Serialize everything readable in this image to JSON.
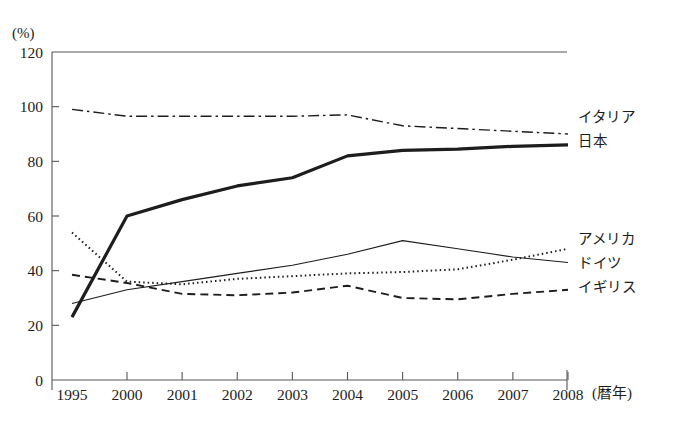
{
  "chart_data": {
    "type": "line",
    "title": "",
    "unit_label": "(%)",
    "xlabel": "(暦年)",
    "ylabel": "",
    "x": [
      1995,
      2000,
      2001,
      2002,
      2003,
      2004,
      2005,
      2006,
      2007,
      2008
    ],
    "categories": [
      "1995",
      "2000",
      "2001",
      "2002",
      "2003",
      "2004",
      "2005",
      "2006",
      "2007",
      "2008"
    ],
    "ylim": [
      0,
      120
    ],
    "yticks": [
      0,
      20,
      40,
      60,
      80,
      100,
      120
    ],
    "grid": false,
    "legend_position": "right-inline",
    "series": [
      {
        "name": "イタリア",
        "style": "dash-dot",
        "values": [
          99,
          96.5,
          96.5,
          96.5,
          96.5,
          97,
          93,
          92,
          91,
          90
        ]
      },
      {
        "name": "日本",
        "style": "thick-solid",
        "values": [
          23,
          60,
          66,
          71,
          74,
          82,
          84,
          84.5,
          85.5,
          86
        ]
      },
      {
        "name": "アメリカ",
        "style": "dotted",
        "values": [
          54,
          36,
          35,
          37,
          38,
          39,
          39.5,
          40.5,
          44,
          48
        ]
      },
      {
        "name": "ドイツ",
        "style": "thin-solid",
        "values": [
          28,
          33,
          36,
          39,
          42,
          46,
          51,
          48,
          45,
          43
        ]
      },
      {
        "name": "イギリス",
        "style": "dashed",
        "values": [
          38.5,
          35.5,
          31.5,
          31,
          32,
          34.5,
          30,
          29.5,
          31.5,
          33
        ]
      }
    ]
  },
  "legend": {
    "top_group": [
      "イタリア",
      "日本"
    ],
    "bottom_group": [
      "アメリカ",
      "ドイツ",
      "イギリス"
    ]
  },
  "footer": {
    "caption": ""
  },
  "colors": {
    "line": "#1d1d1d",
    "axis": "#55565a",
    "background": "#ffffff"
  }
}
